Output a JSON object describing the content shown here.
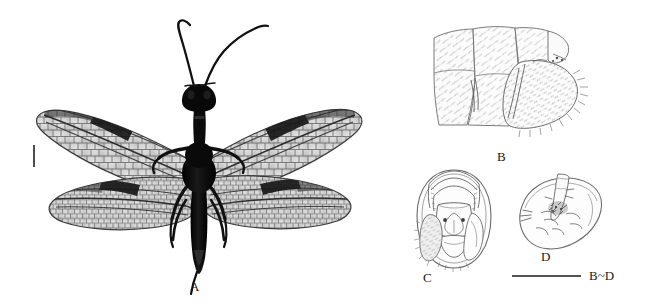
{
  "figure": {
    "background_color": "#ffffff",
    "width": 647,
    "height": 305,
    "ink_color": "#1a1a1a",
    "line_drawing_color": "#5a5a5a",
    "membrane_color": "#d9d9d9",
    "body_color": "#0d0d0d"
  },
  "panels": [
    {
      "id": "A",
      "label": "A",
      "label_x": 196,
      "label_y": 290,
      "type": "photograph",
      "subject": "whole-insect-dorsal-habitus",
      "description": "Adult insect, dorsal view, four membranous wings spread, dark body, long filiform antennae",
      "features": {
        "wings": 4,
        "wing_membrane_shade": "#d4d4d4",
        "wing_dark_band": "pterostigmal-dark-patch",
        "antennae": 2,
        "legs": 6,
        "body_shade": "#0d0d0d"
      },
      "scale_bar": {
        "orientation": "vertical",
        "x": 34,
        "y_top": 145,
        "y_bottom": 167,
        "color": "#3a3a3a"
      }
    },
    {
      "id": "B",
      "label": "B",
      "label_x": 497,
      "label_y": 153,
      "type": "line-drawing",
      "subject": "terminal-abdominal-segments-lateral",
      "description": "Lateral view of terminal abdominal segments and ectoproct, with dense fine setae"
    },
    {
      "id": "C",
      "label": "C",
      "label_x": 428,
      "label_y": 291,
      "type": "line-drawing",
      "subject": "genital-complex-ventral",
      "description": "Ventral view of genital capsule, oval outline with median shield plate and setose lateral lobe"
    },
    {
      "id": "D",
      "label": "D",
      "label_x": 541,
      "label_y": 261,
      "type": "line-drawing",
      "subject": "genital-complex-oblique",
      "description": "Oblique lateral view of genital sclerite, leaf-shaped outline with internal processes"
    }
  ],
  "scale_bars": [
    {
      "id": "bd-scale",
      "caption": "B~D",
      "caption_x": 590,
      "caption_y": 281,
      "bar_x_start": 512,
      "bar_x_end": 581,
      "bar_y": 276,
      "orientation": "horizontal",
      "color": "#1a1a1a"
    }
  ]
}
